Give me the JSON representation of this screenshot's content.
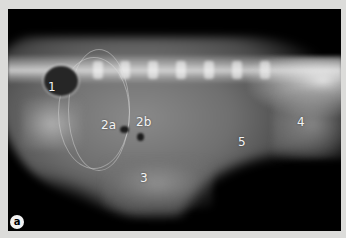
{
  "figure": {
    "panel_label": "a",
    "image_type": "lateral abdominal radiograph",
    "labels": [
      {
        "id": "1",
        "text": "1",
        "x": 48,
        "y": 81
      },
      {
        "id": "2a",
        "text": "2a",
        "x": 101,
        "y": 119
      },
      {
        "id": "2b",
        "text": "2b",
        "x": 136,
        "y": 116
      },
      {
        "id": "3",
        "text": "3",
        "x": 140,
        "y": 172
      },
      {
        "id": "4",
        "text": "4",
        "x": 297,
        "y": 116
      },
      {
        "id": "5",
        "text": "5",
        "x": 238,
        "y": 136
      }
    ]
  },
  "colors": {
    "border": "#dcdcda",
    "background": "#000000",
    "label": "#f4f4f4"
  }
}
